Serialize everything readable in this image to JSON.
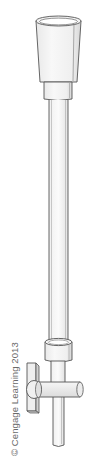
{
  "figure": {
    "parts": [
      "funnel-top",
      "collar",
      "graduated-tube",
      "stopcock-collar",
      "stopcock-valve",
      "stopcock-handle",
      "delivery-tip"
    ],
    "caption": "© Cengage Learning 2013"
  },
  "colors": {
    "outline": "#555555",
    "fill_light": "#f4f4f4",
    "fill_mid": "#e6e6e6",
    "fill_shadow": "#d2d2d2",
    "caption": "#6a6a6a"
  }
}
